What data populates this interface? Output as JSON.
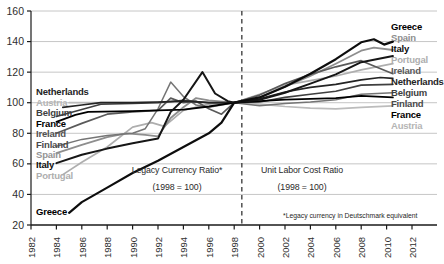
{
  "chart_data": {
    "type": "line",
    "title": "",
    "xlabel": "",
    "ylabel": "",
    "x_axis": {
      "ticks": [
        1982,
        1984,
        1986,
        1988,
        1990,
        1992,
        1994,
        1996,
        1998,
        2000,
        2002,
        2004,
        2006,
        2008,
        2010,
        2012
      ],
      "rotation": "vertical"
    },
    "y_axis": {
      "ticks": [
        20,
        40,
        60,
        80,
        100,
        120,
        140,
        160
      ],
      "range": [
        20,
        160
      ],
      "grid": true
    },
    "divider_year": 1998.6,
    "annotations": {
      "left_region_title": "Legacy Currency Ratio*",
      "left_region_subtitle": "(1998 = 100)",
      "right_region_title": "Unit Labor Cost Ratio",
      "right_region_subtitle": "(1998 = 100)",
      "footnote": "*Legacy currency in Deutschmark equivalent"
    },
    "series": [
      {
        "name": "Austria",
        "color": "#bcbcbc",
        "width": 1.7,
        "points": [
          [
            1985,
            100
          ],
          [
            1990,
            100
          ],
          [
            1994,
            100.5
          ],
          [
            1998,
            100
          ],
          [
            2000,
            99
          ],
          [
            2002,
            97.5
          ],
          [
            2004,
            96.5
          ],
          [
            2006,
            96
          ],
          [
            2008,
            97
          ],
          [
            2010.5,
            98
          ]
        ]
      },
      {
        "name": "Portugal",
        "color": "#aeaeae",
        "width": 1.7,
        "points": [
          [
            1984.5,
            53
          ],
          [
            1986,
            61
          ],
          [
            1988,
            71
          ],
          [
            1990,
            84
          ],
          [
            1991.5,
            87
          ],
          [
            1992.5,
            84.5
          ],
          [
            1994,
            95
          ],
          [
            1996,
            99
          ],
          [
            1998,
            100
          ],
          [
            2000,
            105.5
          ],
          [
            2002,
            111.5
          ],
          [
            2004,
            114.5
          ],
          [
            2006,
            117.5
          ],
          [
            2008,
            121.5
          ],
          [
            2010.5,
            125.5
          ]
        ]
      },
      {
        "name": "Spain",
        "color": "#8e8e8e",
        "width": 1.8,
        "points": [
          [
            1984,
            67
          ],
          [
            1986,
            72.5
          ],
          [
            1988,
            77.5
          ],
          [
            1989.5,
            80
          ],
          [
            1991,
            79
          ],
          [
            1992,
            78
          ],
          [
            1993,
            90
          ],
          [
            1994,
            97
          ],
          [
            1995,
            103
          ],
          [
            1996,
            101.5
          ],
          [
            1998,
            100
          ],
          [
            2000,
            103.5
          ],
          [
            2002,
            110.5
          ],
          [
            2004,
            117.5
          ],
          [
            2006,
            125.5
          ],
          [
            2008,
            134
          ],
          [
            2009,
            136
          ],
          [
            2010.5,
            134.5
          ]
        ]
      },
      {
        "name": "Finland",
        "color": "#757575",
        "width": 1.5,
        "points": [
          [
            1984,
            71.5
          ],
          [
            1986,
            76
          ],
          [
            1988,
            78.5
          ],
          [
            1990,
            80
          ],
          [
            1991,
            83
          ],
          [
            1992,
            96
          ],
          [
            1993,
            113.5
          ],
          [
            1994,
            104
          ],
          [
            1995,
            98.5
          ],
          [
            1996,
            97
          ],
          [
            1998,
            100
          ],
          [
            2000,
            98
          ],
          [
            2002,
            99.5
          ],
          [
            2004,
            100.5
          ],
          [
            2006,
            102
          ],
          [
            2008,
            105.5
          ],
          [
            2010.5,
            106.5
          ]
        ]
      },
      {
        "name": "Ireland",
        "color": "#5a5a5a",
        "width": 1.7,
        "points": [
          [
            1984,
            80
          ],
          [
            1986,
            86.5
          ],
          [
            1988,
            92.5
          ],
          [
            1990,
            94
          ],
          [
            1992,
            95
          ],
          [
            1993,
            103
          ],
          [
            1994,
            100
          ],
          [
            1995,
            101
          ],
          [
            1996,
            96
          ],
          [
            1997,
            92.5
          ],
          [
            1998,
            100
          ],
          [
            2000,
            105
          ],
          [
            2002,
            112.5
          ],
          [
            2004,
            118.5
          ],
          [
            2006,
            123.5
          ],
          [
            2008,
            127.5
          ],
          [
            2009,
            124
          ],
          [
            2010.5,
            119
          ]
        ]
      },
      {
        "name": "Belgium",
        "color": "#3f3f3f",
        "width": 1.6,
        "points": [
          [
            1984,
            91
          ],
          [
            1986,
            95.5
          ],
          [
            1987.5,
            99
          ],
          [
            1990,
            99.5
          ],
          [
            1992,
            100
          ],
          [
            1994,
            101.5
          ],
          [
            1996,
            100
          ],
          [
            1998,
            100
          ],
          [
            2000,
            100.5
          ],
          [
            2002,
            103.5
          ],
          [
            2004,
            105.5
          ],
          [
            2006,
            107.5
          ],
          [
            2008,
            111.5
          ],
          [
            2010.5,
            112
          ]
        ]
      },
      {
        "name": "Netherlands",
        "color": "#242424",
        "width": 1.7,
        "points": [
          [
            1984.5,
            97
          ],
          [
            1986,
            98.5
          ],
          [
            1987.5,
            100
          ],
          [
            1990,
            100
          ],
          [
            1992,
            100.5
          ],
          [
            1994,
            101
          ],
          [
            1996,
            100
          ],
          [
            1998,
            100
          ],
          [
            2000,
            102.5
          ],
          [
            2002,
            107
          ],
          [
            2004,
            110
          ],
          [
            2006,
            112
          ],
          [
            2008,
            115
          ],
          [
            2009.5,
            116.5
          ],
          [
            2010.5,
            116
          ]
        ]
      },
      {
        "name": "France",
        "color": "#000000",
        "width": 1.8,
        "points": [
          [
            1984,
            87.5
          ],
          [
            1985.5,
            92
          ],
          [
            1986.5,
            94
          ],
          [
            1990,
            94.5
          ],
          [
            1992,
            95
          ],
          [
            1994,
            95.5
          ],
          [
            1996,
            97.5
          ],
          [
            1998,
            100
          ],
          [
            2000,
            101
          ],
          [
            2002,
            102
          ],
          [
            2004,
            102.5
          ],
          [
            2006,
            103
          ],
          [
            2008,
            104.5
          ],
          [
            2010.5,
            103.5
          ]
        ]
      },
      {
        "name": "Italy",
        "color": "#161616",
        "width": 2.0,
        "points": [
          [
            1984,
            60.5
          ],
          [
            1986,
            66
          ],
          [
            1988,
            70
          ],
          [
            1990,
            73.5
          ],
          [
            1992,
            76.5
          ],
          [
            1993,
            94
          ],
          [
            1994,
            102
          ],
          [
            1995.5,
            120
          ],
          [
            1996.5,
            106
          ],
          [
            1997.5,
            101
          ],
          [
            1998,
            100
          ],
          [
            2000,
            102
          ],
          [
            2002,
            106.5
          ],
          [
            2004,
            112.5
          ],
          [
            2006,
            118.5
          ],
          [
            2008,
            126.5
          ],
          [
            2010.5,
            130.5
          ]
        ]
      },
      {
        "name": "Greece",
        "color": "#0d0d0d",
        "width": 2.2,
        "points": [
          [
            1985,
            28
          ],
          [
            1986,
            35
          ],
          [
            1988,
            44.5
          ],
          [
            1990,
            54
          ],
          [
            1992,
            62
          ],
          [
            1994,
            71
          ],
          [
            1996,
            80
          ],
          [
            1997,
            87
          ],
          [
            1998,
            100
          ],
          [
            2000,
            103.5
          ],
          [
            2002,
            110.5
          ],
          [
            2004,
            119
          ],
          [
            2006,
            128.5
          ],
          [
            2008,
            139.5
          ],
          [
            2009,
            141.5
          ],
          [
            2009.8,
            138
          ],
          [
            2010.5,
            140
          ]
        ]
      }
    ],
    "left_labels": [
      {
        "text": "Netherlands",
        "y": 92,
        "color": "#242424"
      },
      {
        "text": "Austria",
        "y": 103,
        "color": "#b5b5b5"
      },
      {
        "text": "Belgium",
        "y": 113,
        "color": "#3f3f3f"
      },
      {
        "text": "France",
        "y": 124,
        "color": "#000000"
      },
      {
        "text": "Ireland",
        "y": 134,
        "color": "#525252"
      },
      {
        "text": "Finland",
        "y": 145,
        "color": "#4a4a4a"
      },
      {
        "text": "Spain",
        "y": 155,
        "color": "#949494"
      },
      {
        "text": "Italy",
        "y": 165,
        "color": "#0d0d0d"
      },
      {
        "text": "Portugal",
        "y": 176,
        "color": "#aeaeae"
      },
      {
        "text": "Greece",
        "y": 212,
        "color": "#000000"
      }
    ],
    "right_labels": [
      {
        "text": "Greece",
        "y": 27,
        "color": "#000000"
      },
      {
        "text": "Spain",
        "y": 38,
        "color": "#8e8e8e"
      },
      {
        "text": "Italy",
        "y": 49,
        "color": "#0d0d0d"
      },
      {
        "text": "Portugal",
        "y": 60,
        "color": "#aeaeae"
      },
      {
        "text": "Ireland",
        "y": 71,
        "color": "#5a5a5a"
      },
      {
        "text": "Netherlands",
        "y": 82,
        "color": "#242424"
      },
      {
        "text": "Belgium",
        "y": 93,
        "color": "#3f3f3f"
      },
      {
        "text": "Finland",
        "y": 104,
        "color": "#4a4a4a"
      },
      {
        "text": "France",
        "y": 115,
        "color": "#000000"
      },
      {
        "text": "Austria",
        "y": 126,
        "color": "#b5b5b5"
      }
    ],
    "colors": {
      "gridline": "#c6c6c6",
      "axis": "#1a1a1a",
      "tick_text": "#2e2e2e",
      "divider": "#444444"
    }
  }
}
